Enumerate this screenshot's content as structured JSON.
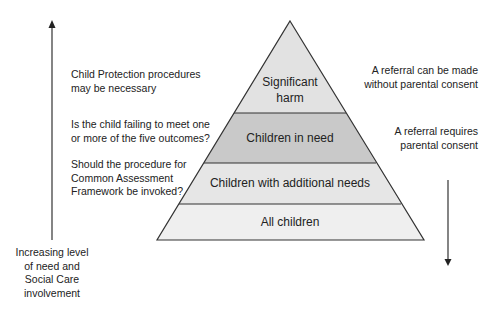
{
  "pyramid": {
    "layers": [
      {
        "label_lines": [
          "Significant",
          "harm"
        ],
        "fill": "#e2e2e2"
      },
      {
        "label_lines": [
          "Children in need"
        ],
        "fill": "#c9c9c9"
      },
      {
        "label_lines": [
          "Children with additional needs"
        ],
        "fill": "#e6e6e6"
      },
      {
        "label_lines": [
          "All children"
        ],
        "fill": "#efefef"
      }
    ],
    "outline_color": "#333333"
  },
  "left_annotations": [
    {
      "lines": [
        "Child Protection procedures",
        "may be necessary"
      ]
    },
    {
      "lines": [
        "Is the child failing to meet one",
        "or more of the five outcomes?"
      ]
    },
    {
      "lines": [
        "Should the procedure for",
        "Common Assessment",
        "Framework be invoked?"
      ]
    }
  ],
  "right_annotations": [
    {
      "lines": [
        "A referral can be made",
        "without parental consent"
      ]
    },
    {
      "lines": [
        "A referral requires",
        "parental consent"
      ]
    }
  ],
  "left_axis": {
    "direction": "up",
    "label_lines": [
      "Increasing level",
      "of need and",
      "Social Care",
      "involvement"
    ]
  },
  "right_axis": {
    "direction": "down"
  }
}
